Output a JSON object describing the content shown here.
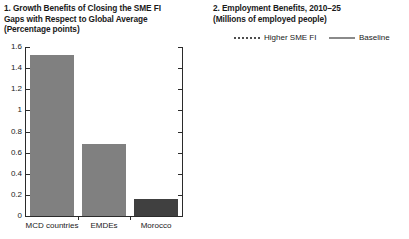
{
  "figure": {
    "background": "#ffffff",
    "text_color": "#1a1a1a"
  },
  "panel1": {
    "title_line1": "1. Growth Benefits of Closing the SME FI",
    "title_line2": "Gaps with Respect to Global Average",
    "title_line3": "(Percentage points)",
    "colors": {
      "bar_default": "#808080",
      "bar_morocco": "#404040",
      "axis": "#2b2b2b"
    }
  },
  "panel2": {
    "title_line1": "2. Employment Benefits, 2010–25",
    "title_line2": "(Millions of employed people)",
    "legend": [
      {
        "label": "Higher SME FI",
        "style": "dashed",
        "color": "#4d4d4d"
      },
      {
        "label": "Baseline",
        "style": "solid",
        "color": "#8a8a8a"
      }
    ],
    "projection_label": "Projection",
    "note_line1": "16.6 additional jobs",
    "note_line2": "by 2025, of which",
    "note_line3": "14.3 in MENAP and",
    "note_line4": "2.3 in CCA countries",
    "colors": {
      "higher": "#4d4d4d",
      "baseline": "#8a8a8a",
      "axis": "#2b2b2b"
    }
  },
  "chart_data": [
    {
      "type": "bar",
      "title": "1. Growth Benefits of Closing the SME FI Gaps with Respect to Global Average",
      "subtitle": "(Percentage points)",
      "xlabel": "",
      "ylabel": "Percentage points",
      "categories": [
        "MCD countries",
        "EMDEs",
        "Morocco"
      ],
      "values": [
        1.52,
        0.68,
        0.16
      ],
      "colors": [
        "#808080",
        "#808080",
        "#404040"
      ],
      "ylim": [
        0,
        1.6
      ],
      "yticks": [
        0,
        0.2,
        0.4,
        0.6,
        0.8,
        1,
        1.2,
        1.4,
        1.6
      ],
      "ytick_labels": [
        "0",
        "0.2",
        "0.4",
        "0.6",
        "0.8",
        "1",
        "1.2",
        "1.4",
        "1.6"
      ],
      "grid": false,
      "legend": "none",
      "right_axis_ticks_unlabeled": true
    },
    {
      "type": "line",
      "title": "2. Employment Benefits, 2010–25",
      "subtitle": "(Millions of employed people)",
      "xlabel": "",
      "ylabel": "Millions of employed people",
      "x": [
        2013,
        2014,
        2015,
        2016,
        2017,
        2017.5,
        2019,
        2021,
        2023,
        2025
      ],
      "xlim": [
        2013,
        2025
      ],
      "xticks": [
        2013,
        2015,
        2017,
        2019,
        2021,
        2023,
        2025
      ],
      "xtick_labels": [
        "2013",
        "15",
        "17",
        "19",
        "21",
        "23",
        "25"
      ],
      "ylim": [
        200,
        340
      ],
      "yticks": [
        200,
        220,
        240,
        260,
        280,
        300,
        320,
        340
      ],
      "ytick_labels": [
        "200",
        "220",
        "240",
        "260",
        "280",
        "300",
        "320",
        "340"
      ],
      "y_axis_side": "right",
      "grid": false,
      "legend_position": "top",
      "projection_start": 2017.5,
      "series": [
        {
          "name": "Baseline",
          "style": "solid-then-dashed",
          "color": "#8a8a8a",
          "values": [
            240,
            244,
            248,
            252,
            256,
            258,
            272,
            287,
            301,
            315
          ]
        },
        {
          "name": "Higher SME FI",
          "style": "dashed",
          "color": "#4d4d4d",
          "values": [
            null,
            null,
            null,
            null,
            null,
            258,
            274,
            293,
            312,
            332
          ]
        }
      ],
      "annotations": [
        {
          "text": "Projection",
          "x": 2021.5,
          "y": 322
        },
        {
          "text": "16.6 additional jobs by 2025, of which 14.3 in MENAP and 2.3 in CCA countries",
          "x": 2018,
          "y": 250
        }
      ]
    }
  ]
}
